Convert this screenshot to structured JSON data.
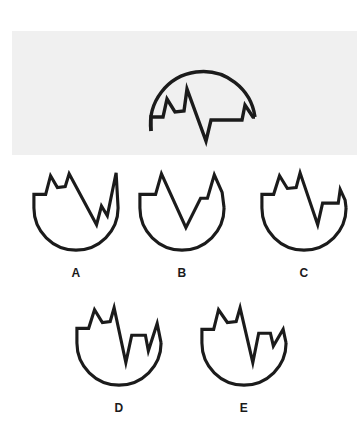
{
  "puzzle": {
    "type": "spatial-rotation-multiple-choice",
    "question_count": 1,
    "option_count": 5
  },
  "colors": {
    "page_background": "#ffffff",
    "band_background": "#f0f0f0",
    "ink": "#1b1b1b",
    "label_text": "#1a1a1a"
  },
  "reference": {
    "name": "reference-figure",
    "description": "jagged-crowned semicircular shape shown inverted (dome up, zigzag edge along the bottom)",
    "orientation": "inverted",
    "band": {
      "x": 12,
      "y": 31,
      "width": 345,
      "height": 124
    },
    "path": "M 139 100 L 139 86 L 151 86 L 155 68 L 163 81 L 172 80 L 175 58 L 194 110 L 199 89 L 230 89 L 233 74 L 241 86 L 243 86"
  },
  "options": [
    {
      "id": "A",
      "label": "A",
      "name": "option-a",
      "row": "top",
      "description": "bowl with two small left peaks, deep narrow V in the middle-right, tall right spike",
      "path": "M 10 46 L 10 32 L 22 32 L 27 13 L 34 25 L 42 24 L 46 11 L 74 63 L 79 44 L 85 54 L 94 10 L 96 46"
    },
    {
      "id": "B",
      "label": "B",
      "name": "option-b",
      "row": "top",
      "description": "bowl with one tall left peak, wide central V, stepped plateau then right spike",
      "path": "M 10 46 L 10 32 L 26 32 L 32 11 L 57 66 L 72 36 L 79 36 L 86 12 L 94 30 L 96 46"
    },
    {
      "id": "C",
      "label": "C",
      "name": "option-c",
      "row": "top",
      "description": "bowl with twin left peaks, deep central V, low plateau and narrow right spike",
      "path": "M 10 46 L 10 32 L 22 32 L 28 13 L 36 26 L 45 25 L 49 10 L 67 63 L 72 41 L 88 41 L 90 27 L 95 38 L 96 46"
    },
    {
      "id": "D",
      "label": "D",
      "name": "option-d",
      "row": "bottom",
      "description": "bowl with twin left peaks, long deep V, raised plateau then right peak",
      "path": "M 10 46 L 10 31 L 22 31 L 28 12 L 36 25 L 44 24 L 48 10 L 60 66 L 66 38 L 80 38 L 83 54 L 92 26 L 96 46"
    },
    {
      "id": "E",
      "label": "E",
      "name": "option-e",
      "row": "bottom",
      "description": "bowl with twin left peaks, deep V, short plateau and shallow right notch",
      "path": "M 10 46 L 10 32 L 22 32 L 27 12 L 36 25 L 45 24 L 49 10 L 62 66 L 68 36 L 80 36 L 83 49 L 93 32 L 96 46"
    }
  ]
}
